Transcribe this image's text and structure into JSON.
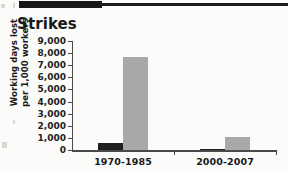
{
  "header": {
    "rule_present": true
  },
  "chart_data": {
    "type": "bar",
    "title": "Strikes",
    "xlabel": "",
    "ylabel_line1": "Working days lost",
    "ylabel_line2": "per 1,000 workers",
    "categories": [
      "1970-1985",
      "2000-2007"
    ],
    "series": [
      {
        "name": "dark",
        "color": "#1f1f1f",
        "values": [
          600,
          100
        ]
      },
      {
        "name": "gray",
        "color": "#a8a8a8",
        "values": [
          7700,
          1100
        ]
      }
    ],
    "ylim": [
      0,
      9000
    ],
    "ytick_values": [
      9000,
      8000,
      7000,
      6000,
      5000,
      4000,
      3000,
      2000,
      1000,
      0
    ],
    "ytick_labels": [
      "9,000",
      "8,000",
      "7,000",
      "6,000",
      "5,000",
      "4,000",
      "3,000",
      "2,000",
      "1,000",
      "0"
    ],
    "grid": false,
    "legend": "none"
  }
}
